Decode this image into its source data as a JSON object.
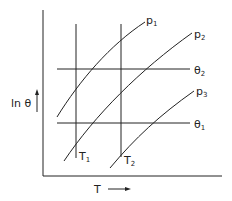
{
  "diagram": {
    "x_axis_label": "T",
    "y_axis_label": "ln θ",
    "curves": [
      {
        "name": "p",
        "sub": "1"
      },
      {
        "name": "p",
        "sub": "2"
      },
      {
        "name": "p",
        "sub": "3"
      }
    ],
    "horizontal_lines": [
      {
        "name": "θ",
        "sub": "2"
      },
      {
        "name": "θ",
        "sub": "1"
      }
    ],
    "vertical_lines": [
      {
        "name": "T",
        "sub": "1"
      },
      {
        "name": "T",
        "sub": "2"
      }
    ]
  }
}
